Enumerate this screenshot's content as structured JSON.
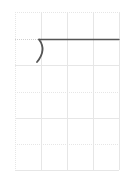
{
  "diagram": {
    "grid": {
      "columns": 4,
      "rows": 6,
      "left": 15,
      "top": 12,
      "right": 119,
      "bottom": 170,
      "line_color": "#e4e4e4",
      "major_dash_color": "#d8d8d8"
    },
    "stroke": {
      "color": "#555555",
      "horizontal_line": {
        "x1": 39,
        "y1": 39,
        "x2": 119,
        "y2": 39
      },
      "bracket_curve": {
        "start": [
          39,
          39
        ],
        "control": [
          46,
          50
        ],
        "end": [
          37,
          62
        ]
      }
    }
  }
}
